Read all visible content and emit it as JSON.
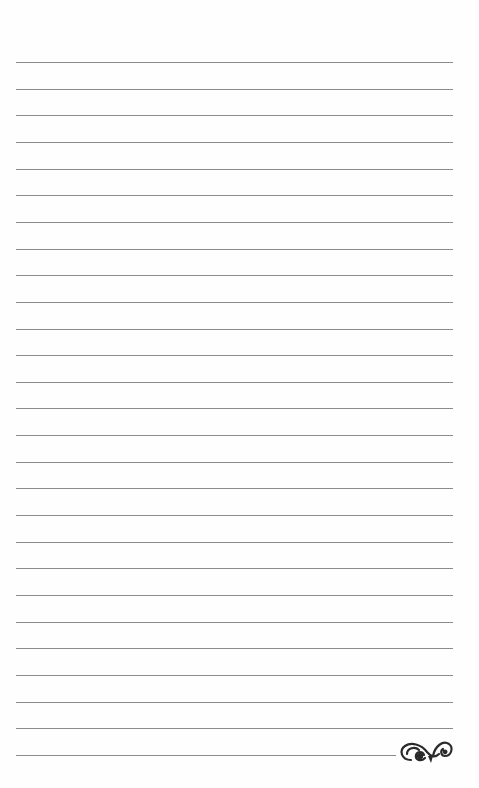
{
  "page": {
    "background": "#ffffff",
    "rule_color": "#8a8a8a",
    "rule_count": 27,
    "first_rule_y": 62,
    "rule_spacing": 26.65,
    "rule_left": 16,
    "rule_right": 453,
    "last_rule_right": 396
  },
  "ornament": {
    "icon": "flourish-ornament-icon",
    "color": "#2a2a2a"
  }
}
